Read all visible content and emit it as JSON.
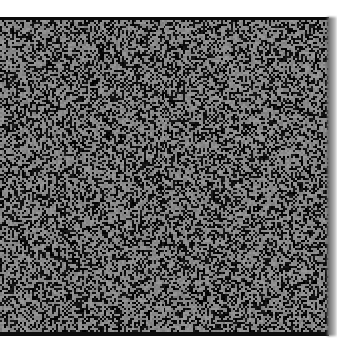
{
  "image": {
    "description": "Square field of gray and black random speckle noise",
    "colors": {
      "light_speckle": "#8a8a8a",
      "dark_speckle": "#0e0e0e",
      "border": "#0a0a0a",
      "background": "#ffffff"
    },
    "noise_seed": 1337,
    "dark_ratio": 0.42
  }
}
